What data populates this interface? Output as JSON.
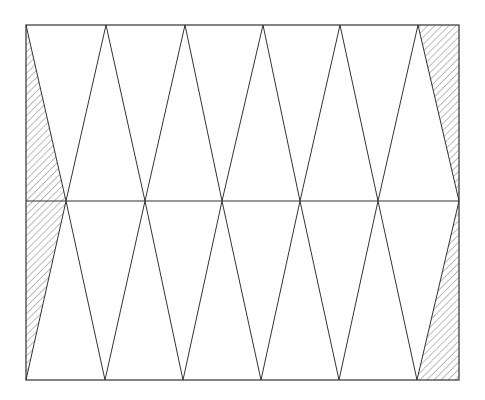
{
  "diagram": {
    "frame": {
      "x1": 26,
      "y1": 25,
      "x2": 459,
      "y2": 380
    },
    "midline_y": 201,
    "top_vertices_x": [
      26,
      106,
      185,
      263,
      340,
      418
    ],
    "mid_vertices_x": [
      66,
      145,
      222,
      300,
      378
    ],
    "bottom_vertices_x": [
      26,
      105,
      183,
      261,
      339,
      417
    ],
    "hatched_regions": [
      {
        "name": "top-left",
        "points": [
          [
            26,
            25
          ],
          [
            66,
            201
          ],
          [
            26,
            201
          ]
        ]
      },
      {
        "name": "bottom-left",
        "points": [
          [
            26,
            201
          ],
          [
            66,
            201
          ],
          [
            26,
            380
          ]
        ]
      },
      {
        "name": "top-right",
        "points": [
          [
            418,
            25
          ],
          [
            459,
            25
          ],
          [
            459,
            201
          ]
        ]
      },
      {
        "name": "bottom-right",
        "points": [
          [
            459,
            201
          ],
          [
            459,
            380
          ],
          [
            417,
            380
          ]
        ]
      }
    ],
    "colors": {
      "line": "#333333",
      "hatch": "#555555",
      "background": "#ffffff"
    }
  }
}
